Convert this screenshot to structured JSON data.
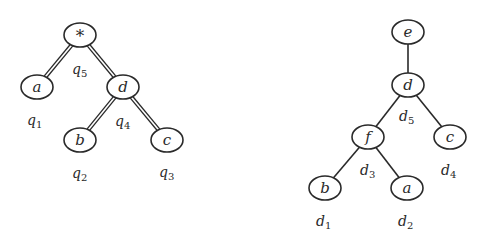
{
  "trees": [
    {
      "name": "query-tree",
      "edge_style": "double",
      "nodes": [
        {
          "id": "q5",
          "label": "*",
          "x": 80,
          "y": 35
        },
        {
          "id": "q1",
          "label": "a",
          "x": 37,
          "y": 87
        },
        {
          "id": "q4",
          "label": "d",
          "x": 123,
          "y": 87
        },
        {
          "id": "q2",
          "label": "b",
          "x": 80,
          "y": 140
        },
        {
          "id": "q3",
          "label": "c",
          "x": 167,
          "y": 140
        }
      ],
      "edges": [
        [
          "q5",
          "q1"
        ],
        [
          "q5",
          "q4"
        ],
        [
          "q4",
          "q2"
        ],
        [
          "q4",
          "q3"
        ]
      ],
      "annotations": [
        {
          "base": "q",
          "sub": "5",
          "x": 72,
          "y": 74
        },
        {
          "base": "q",
          "sub": "1",
          "x": 27,
          "y": 125
        },
        {
          "base": "q",
          "sub": "4",
          "x": 115,
          "y": 126
        },
        {
          "base": "q",
          "sub": "2",
          "x": 72,
          "y": 178
        },
        {
          "base": "q",
          "sub": "3",
          "x": 159,
          "y": 177
        }
      ]
    },
    {
      "name": "data-tree",
      "edge_style": "single",
      "nodes": [
        {
          "id": "e",
          "label": "e",
          "x": 408,
          "y": 32
        },
        {
          "id": "d5",
          "label": "d",
          "x": 408,
          "y": 85
        },
        {
          "id": "d3",
          "label": "f",
          "x": 368,
          "y": 137
        },
        {
          "id": "d4",
          "label": "c",
          "x": 450,
          "y": 137
        },
        {
          "id": "d1",
          "label": "b",
          "x": 325,
          "y": 188
        },
        {
          "id": "d2",
          "label": "a",
          "x": 407,
          "y": 188
        }
      ],
      "edges": [
        [
          "e",
          "d5"
        ],
        [
          "d5",
          "d3"
        ],
        [
          "d5",
          "d4"
        ],
        [
          "d3",
          "d1"
        ],
        [
          "d3",
          "d2"
        ]
      ],
      "annotations": [
        {
          "base": "d",
          "sub": "5",
          "x": 399,
          "y": 121
        },
        {
          "base": "d",
          "sub": "3",
          "x": 360,
          "y": 175
        },
        {
          "base": "d",
          "sub": "4",
          "x": 441,
          "y": 175
        },
        {
          "base": "d",
          "sub": "1",
          "x": 316,
          "y": 226
        },
        {
          "base": "d",
          "sub": "2",
          "x": 398,
          "y": 226
        }
      ]
    }
  ],
  "node_radius": {
    "rx": 16,
    "ry": 12
  },
  "colors": {
    "stroke": "#2a2a2a",
    "background": "#ffffff"
  }
}
